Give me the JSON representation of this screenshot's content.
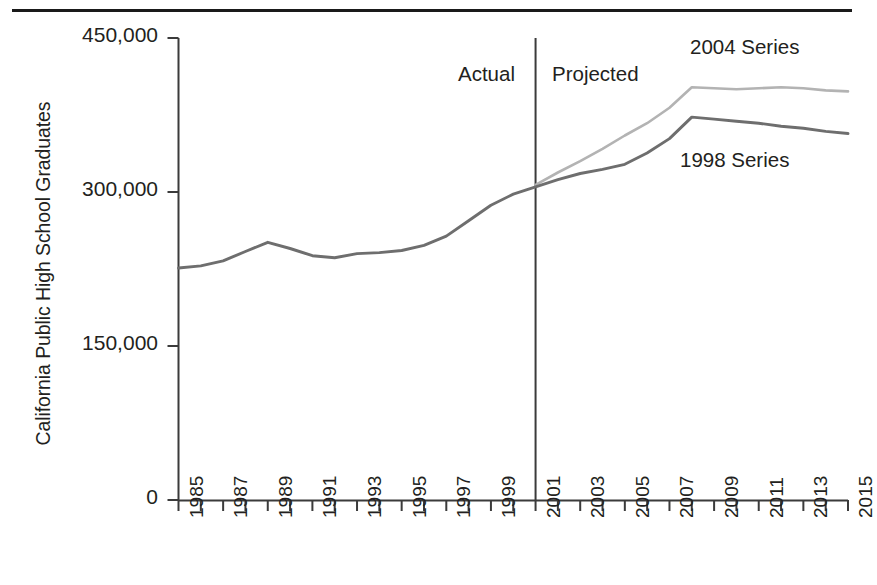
{
  "chart_data": {
    "type": "line",
    "title": "",
    "xlabel": "",
    "ylabel": "California Public High School Graduates",
    "ylim": [
      0,
      450000
    ],
    "yticks": [
      0,
      150000,
      300000,
      450000
    ],
    "ytick_labels": [
      "0",
      "150,000",
      "300,000",
      "450,000"
    ],
    "xlim": [
      1985,
      2015
    ],
    "xticks": [
      1985,
      1987,
      1989,
      1991,
      1993,
      1995,
      1997,
      1999,
      2001,
      2003,
      2005,
      2007,
      2009,
      2011,
      2013,
      2015
    ],
    "xtick_labels": [
      "1985",
      "1987",
      "1989",
      "1991",
      "1993",
      "1995",
      "1997",
      "1999",
      "2001",
      "2003",
      "2005",
      "2007",
      "2009",
      "2011",
      "2013",
      "2015"
    ],
    "x": [
      1985,
      1986,
      1987,
      1988,
      1989,
      1990,
      1991,
      1992,
      1993,
      1994,
      1995,
      1996,
      1997,
      1998,
      1999,
      2000,
      2001,
      2002,
      2003,
      2004,
      2005,
      2006,
      2007,
      2008,
      2009,
      2010,
      2011,
      2012,
      2013,
      2014,
      2015
    ],
    "grid": false,
    "legend_position": "inline-annotations",
    "series": [
      {
        "name": "1998 Series",
        "color": "#6e6e6e",
        "values": [
          226000,
          228000,
          233000,
          242000,
          251000,
          245000,
          238000,
          236000,
          240000,
          241000,
          243000,
          248000,
          257000,
          272000,
          287000,
          298000,
          305000,
          312000,
          318000,
          322000,
          327000,
          338000,
          352000,
          373000,
          371000,
          369000,
          367000,
          364000,
          362000,
          359000,
          357000
        ]
      },
      {
        "name": "2004 Series",
        "color": "#b3b3b3",
        "values": [
          null,
          null,
          null,
          null,
          null,
          null,
          null,
          null,
          null,
          null,
          null,
          null,
          null,
          null,
          null,
          null,
          307000,
          319000,
          330000,
          342000,
          355000,
          367000,
          382000,
          402000,
          401000,
          400000,
          401000,
          402000,
          401000,
          399000,
          398000
        ]
      }
    ],
    "annotations": [
      {
        "text": "Actual",
        "x": 1998.6,
        "y": 417000,
        "name": "actual-label"
      },
      {
        "text": "Projected",
        "x": 2001.7,
        "y": 417000,
        "name": "projected-label"
      },
      {
        "text": "2004 Series",
        "x": 2008.4,
        "y": 440000,
        "name": "series-2004-label"
      },
      {
        "text": "1998 Series",
        "x": 2008.4,
        "y": 333000,
        "name": "series-1998-label"
      }
    ],
    "divider": {
      "x": 2001,
      "label_left": "Actual",
      "label_right": "Projected"
    }
  }
}
